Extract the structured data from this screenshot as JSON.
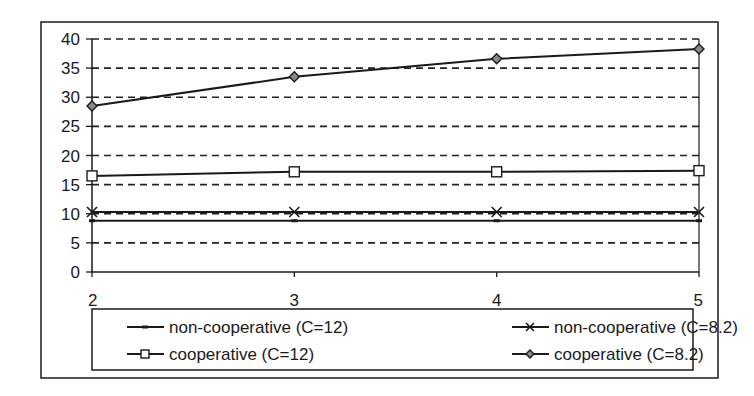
{
  "chart_data": {
    "type": "line",
    "title": "",
    "xlabel": "",
    "ylabel": "",
    "x": [
      2,
      3,
      4,
      5
    ],
    "x_ticks": [
      "2",
      "3",
      "4",
      "5"
    ],
    "y_ticks": [
      "0",
      "5",
      "10",
      "15",
      "20",
      "25",
      "30",
      "35",
      "40"
    ],
    "ylim": [
      0,
      40
    ],
    "xlim": [
      2,
      5
    ],
    "grid": "horizontal dashed",
    "legend_position": "bottom",
    "series": [
      {
        "name": "non-cooperative (C=12)",
        "marker": "dash",
        "values": [
          8.8,
          8.8,
          8.8,
          8.8
        ]
      },
      {
        "name": "non-cooperative (C=8.2)",
        "marker": "x",
        "values": [
          10.3,
          10.3,
          10.3,
          10.3
        ]
      },
      {
        "name": "cooperative (C=12)",
        "marker": "square",
        "values": [
          16.5,
          17.2,
          17.2,
          17.4
        ]
      },
      {
        "name": "cooperative (C=8.2)",
        "marker": "diamond",
        "values": [
          28.5,
          33.5,
          36.6,
          38.3
        ]
      }
    ]
  },
  "legend": {
    "items": [
      {
        "label": "non-cooperative (C=12)"
      },
      {
        "label": "non-cooperative (C=8.2)"
      },
      {
        "label": "cooperative (C=12)"
      },
      {
        "label": "cooperative (C=8.2)"
      }
    ]
  },
  "colors": {
    "line": "#1a1a1a",
    "grid": "#222222",
    "background": "#ffffff"
  }
}
